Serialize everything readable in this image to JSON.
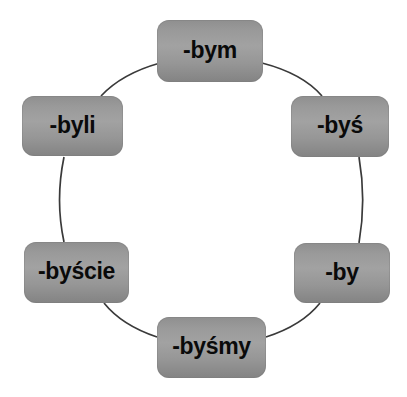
{
  "diagram": {
    "type": "cycle",
    "shape": "circle",
    "background_color": "#ffffff",
    "node_fill_color": "#999999",
    "node_text_color": "#0a0a0a",
    "connector_color": "#3a3a3a",
    "nodes": [
      {
        "id": "node-0",
        "label": "-bym",
        "position": "top"
      },
      {
        "id": "node-1",
        "label": "-byś",
        "position": "upper-right"
      },
      {
        "id": "node-2",
        "label": "-by",
        "position": "lower-right"
      },
      {
        "id": "node-3",
        "label": "-byśmy",
        "position": "bottom"
      },
      {
        "id": "node-4",
        "label": "-byście",
        "position": "lower-left"
      },
      {
        "id": "node-5",
        "label": "-byli",
        "position": "upper-left"
      }
    ],
    "connections": [
      {
        "from": "node-0",
        "to": "node-1"
      },
      {
        "from": "node-1",
        "to": "node-2"
      },
      {
        "from": "node-2",
        "to": "node-3"
      },
      {
        "from": "node-3",
        "to": "node-4"
      },
      {
        "from": "node-4",
        "to": "node-5"
      },
      {
        "from": "node-5",
        "to": "node-0"
      }
    ]
  }
}
